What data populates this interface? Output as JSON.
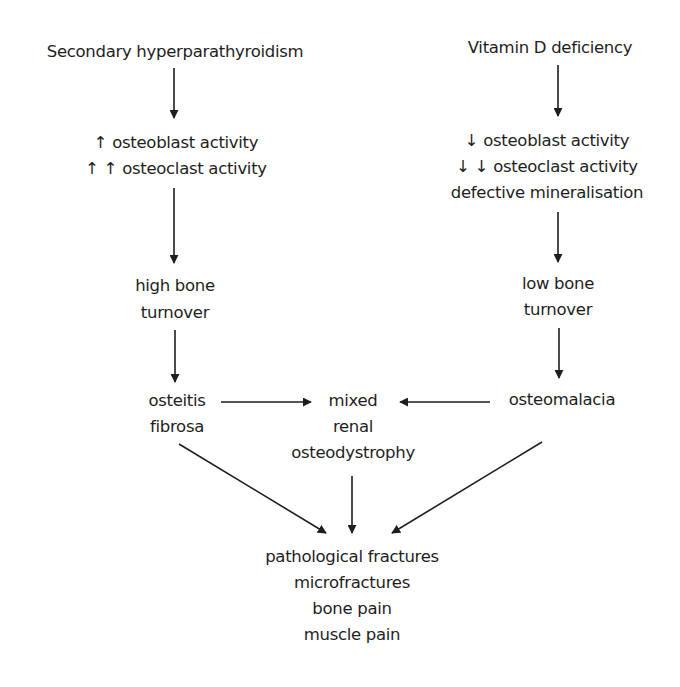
{
  "diagram": {
    "type": "flowchart",
    "nodes": {
      "secondary_hyperparathyroidism": {
        "lines": [
          "Secondary hyperparathyroidism"
        ]
      },
      "vitamin_d_deficiency": {
        "lines": [
          "Vitamin D deficiency"
        ]
      },
      "increased_activity": {
        "lines": [
          "↑ osteoblast activity",
          "↑ ↑ osteoclast activity"
        ]
      },
      "decreased_activity": {
        "lines": [
          "↓ osteoblast activity",
          "↓ ↓ osteoclast activity",
          "defective mineralisation"
        ]
      },
      "high_bone_turnover": {
        "lines": [
          "high bone",
          "turnover"
        ]
      },
      "low_bone_turnover": {
        "lines": [
          "low bone",
          "turnover"
        ]
      },
      "osteitis_fibrosa": {
        "lines": [
          "osteitis",
          "fibrosa"
        ]
      },
      "mixed_renal_osteodystrophy": {
        "lines": [
          "mixed",
          "renal",
          "osteodystrophy"
        ]
      },
      "osteomalacia": {
        "lines": [
          "osteomalacia"
        ]
      },
      "outcomes": {
        "lines": [
          "pathological fractures",
          "microfractures",
          "bone pain",
          "muscle pain"
        ]
      }
    },
    "edges": [
      {
        "from": "secondary_hyperparathyroidism",
        "to": "increased_activity"
      },
      {
        "from": "increased_activity",
        "to": "high_bone_turnover"
      },
      {
        "from": "high_bone_turnover",
        "to": "osteitis_fibrosa"
      },
      {
        "from": "osteitis_fibrosa",
        "to": "mixed_renal_osteodystrophy"
      },
      {
        "from": "osteitis_fibrosa",
        "to": "outcomes"
      },
      {
        "from": "vitamin_d_deficiency",
        "to": "decreased_activity"
      },
      {
        "from": "decreased_activity",
        "to": "low_bone_turnover"
      },
      {
        "from": "low_bone_turnover",
        "to": "osteomalacia"
      },
      {
        "from": "osteomalacia",
        "to": "mixed_renal_osteodystrophy"
      },
      {
        "from": "osteomalacia",
        "to": "outcomes"
      },
      {
        "from": "mixed_renal_osteodystrophy",
        "to": "outcomes"
      }
    ],
    "colors": {
      "background": "#ffffff",
      "ink": "#1e1e1e"
    }
  }
}
